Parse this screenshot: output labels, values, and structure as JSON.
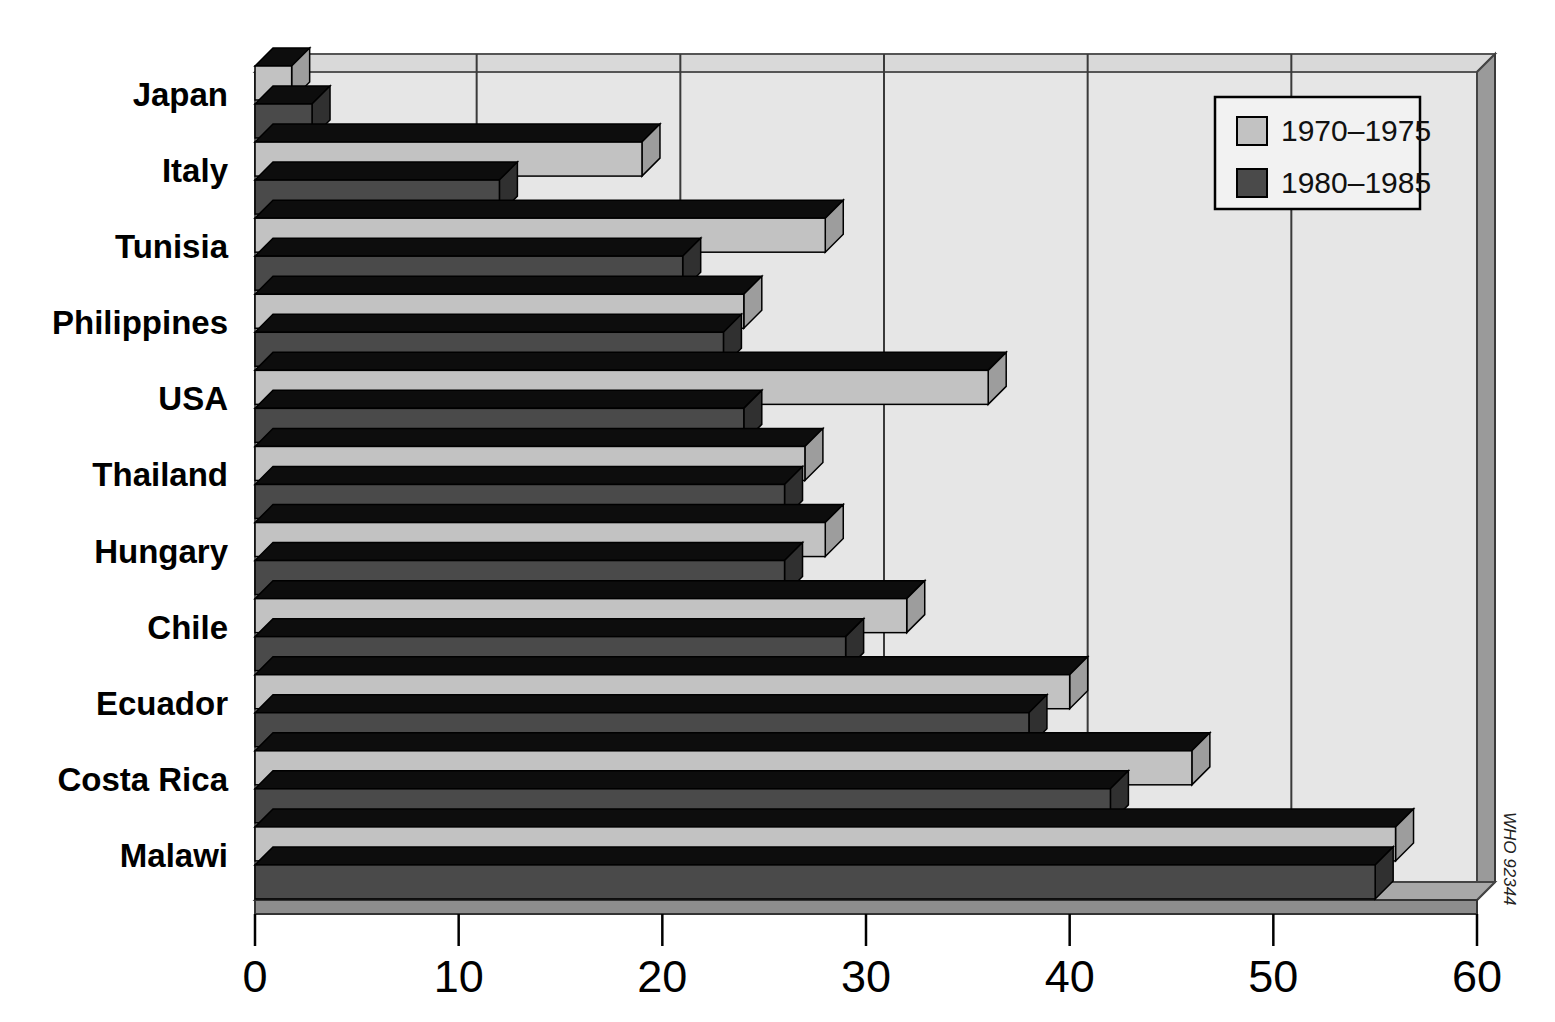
{
  "chart_data": {
    "type": "bar",
    "orientation": "horizontal",
    "title": "",
    "subtitle": "",
    "xlabel": "",
    "ylabel": "",
    "xlim": [
      0,
      60
    ],
    "xticks": [
      0,
      10,
      20,
      30,
      40,
      50,
      60
    ],
    "xtick_labels": [
      "0",
      "10",
      "20",
      "30",
      "40",
      "50",
      "60"
    ],
    "grid": "vertical",
    "legend_position": "top-right",
    "categories": [
      "Japan",
      "Italy",
      "Tunisia",
      "Philippines",
      "USA",
      "Thailand",
      "Hungary",
      "Chile",
      "Ecuador",
      "Costa Rica",
      "Malawi"
    ],
    "series": [
      {
        "name": "1970–1975",
        "color": "#c2c2c2",
        "values": [
          1.8,
          19,
          28,
          24,
          36,
          27,
          28,
          32,
          40,
          46,
          56
        ]
      },
      {
        "name": "1980–1985",
        "color": "#4a4a4a",
        "values": [
          2.8,
          12,
          21,
          23,
          24,
          26,
          26,
          29,
          38,
          42,
          55
        ]
      }
    ],
    "annotations": [
      "WHO 92344"
    ]
  },
  "legend": {
    "items": [
      {
        "label": "1970–1975",
        "swatch": "#c2c2c2"
      },
      {
        "label": "1980–1985",
        "swatch": "#4a4a4a"
      }
    ]
  },
  "axis": {
    "x_ticks": [
      "0",
      "10",
      "20",
      "30",
      "40",
      "50",
      "60"
    ]
  },
  "categories": [
    "Japan",
    "Italy",
    "Tunisia",
    "Philippines",
    "USA",
    "Thailand",
    "Hungary",
    "Chile",
    "Ecuador",
    "Costa Rica",
    "Malawi"
  ],
  "credit": {
    "text": "WHO 92344"
  },
  "colors": {
    "series_light": "#c2c2c2",
    "series_dark": "#4a4a4a",
    "plot_background": "#e6e6e6",
    "wall_side": "#b0b0b0",
    "bar_top_shade": "#0d0d0d",
    "axis_line": "#1a1a1a"
  }
}
